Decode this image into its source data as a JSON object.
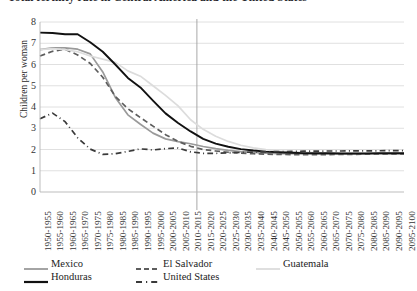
{
  "title": "Total fertility rate in Central America and the United States",
  "axes": {
    "ylabel": "Children per woman",
    "xlabel": "",
    "yticks": [
      "0",
      "1",
      "2",
      "3",
      "4",
      "5",
      "6",
      "7",
      "8"
    ],
    "ylim": [
      0,
      8
    ],
    "grid": "horizontal"
  },
  "legend": {
    "position": "bottom",
    "row1": [
      {
        "label": "Mexico",
        "swatch": "solid-gray",
        "color": "#9a9a9a"
      },
      {
        "label": "El Salvador",
        "swatch": "dashed-dark",
        "color": "#5d5d5d"
      },
      {
        "label": "Guatemala",
        "swatch": "solid-light",
        "color": "#dcdcdc"
      }
    ],
    "row2": [
      {
        "label": "Honduras",
        "swatch": "solid-black",
        "color": "#111111"
      },
      {
        "label": "United States",
        "swatch": "dash-dot",
        "color": "#3a3a3a"
      }
    ]
  },
  "annotations": {
    "divider_label": "estimates / projections boundary",
    "divider_after_period": "2010-2015"
  },
  "chart_data": {
    "type": "line",
    "title": "Total fertility rate in Central America and the United States",
    "xlabel": "",
    "ylabel": "Children per woman",
    "ylim": [
      0,
      8
    ],
    "grid": true,
    "legend_position": "bottom",
    "categories": [
      "1950-1955",
      "1955-1960",
      "1960-1965",
      "1965-1970",
      "1970-1975",
      "1975-1980",
      "1980-1985",
      "1985-1990",
      "1990-1995",
      "1995-2000",
      "2000-2005",
      "2005-2010",
      "2010-2015",
      "2015-2020",
      "2020-2025",
      "2025-2030",
      "2030-2035",
      "2035-2040",
      "2040-2045",
      "2045-2050",
      "2050-2055",
      "2055-2060",
      "2060-2065",
      "2065-2070",
      "2070-2075",
      "2075-2080",
      "2080-2085",
      "2085-2090",
      "2090-2095",
      "2095-2100"
    ],
    "series": [
      {
        "name": "Mexico",
        "color": "#9a9a9a",
        "style": "solid",
        "values": [
          6.7,
          6.78,
          6.78,
          6.72,
          6.5,
          5.65,
          4.45,
          3.63,
          3.19,
          2.77,
          2.5,
          2.37,
          2.27,
          2.14,
          2.04,
          1.96,
          1.9,
          1.86,
          1.83,
          1.81,
          1.8,
          1.79,
          1.79,
          1.79,
          1.79,
          1.79,
          1.8,
          1.8,
          1.8,
          1.81
        ]
      },
      {
        "name": "El Salvador",
        "color": "#5d5d5d",
        "style": "dashed",
        "values": [
          6.4,
          6.62,
          6.72,
          6.45,
          6.05,
          5.4,
          4.5,
          3.92,
          3.5,
          3.1,
          2.7,
          2.38,
          2.15,
          2.0,
          1.93,
          1.87,
          1.83,
          1.8,
          1.78,
          1.77,
          1.76,
          1.76,
          1.76,
          1.76,
          1.77,
          1.77,
          1.78,
          1.78,
          1.79,
          1.79
        ]
      },
      {
        "name": "Guatemala",
        "color": "#dcdcdc",
        "style": "solid",
        "values": [
          6.7,
          6.75,
          6.7,
          6.6,
          6.4,
          6.25,
          6.1,
          5.7,
          5.45,
          5.0,
          4.55,
          4.05,
          3.4,
          2.95,
          2.62,
          2.38,
          2.2,
          2.08,
          1.99,
          1.93,
          1.89,
          1.86,
          1.84,
          1.83,
          1.82,
          1.82,
          1.82,
          1.82,
          1.83,
          1.83
        ]
      },
      {
        "name": "Honduras",
        "color": "#111111",
        "style": "solid",
        "values": [
          7.5,
          7.48,
          7.42,
          7.42,
          7.05,
          6.6,
          6.0,
          5.37,
          4.92,
          4.3,
          3.7,
          3.25,
          2.85,
          2.5,
          2.28,
          2.13,
          2.02,
          1.95,
          1.9,
          1.87,
          1.85,
          1.83,
          1.82,
          1.82,
          1.81,
          1.81,
          1.81,
          1.82,
          1.82,
          1.82
        ]
      },
      {
        "name": "United States",
        "color": "#3a3a3a",
        "style": "dash-dot",
        "values": [
          3.45,
          3.71,
          3.31,
          2.55,
          2.02,
          1.77,
          1.8,
          1.91,
          2.03,
          1.98,
          2.04,
          2.07,
          1.89,
          1.82,
          1.82,
          1.84,
          1.86,
          1.88,
          1.89,
          1.9,
          1.91,
          1.92,
          1.92,
          1.93,
          1.93,
          1.94,
          1.94,
          1.94,
          1.95,
          1.95
        ]
      }
    ]
  }
}
